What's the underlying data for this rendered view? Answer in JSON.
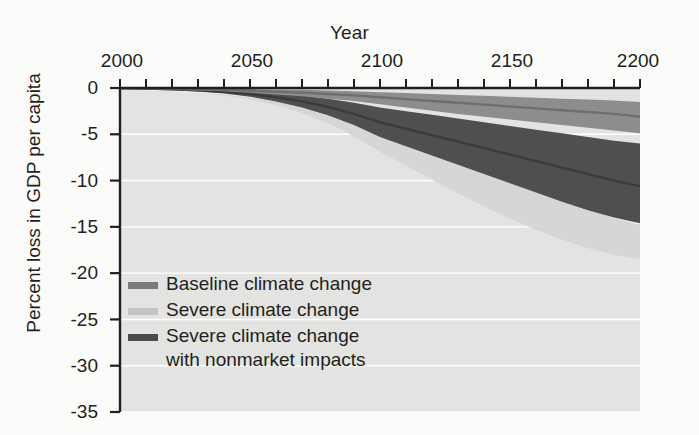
{
  "chart_data": {
    "type": "area",
    "title": "",
    "xlabel": "Year",
    "ylabel": "Percent loss in GDP per capita",
    "xlim": [
      2000,
      2200
    ],
    "ylim": [
      -35,
      0
    ],
    "grid": true,
    "grid_color": "#ffffff",
    "legend_position": "inside-lower-left",
    "x_ticks_major": [
      "2000",
      "2050",
      "2100",
      "2150",
      "2200"
    ],
    "x_tick_values_major": [
      2000,
      2050,
      2100,
      2150,
      2200
    ],
    "x_tick_interval_minor": 10,
    "y_ticks": [
      "0",
      "-5",
      "-10",
      "-15",
      "-20",
      "-25",
      "-30",
      "-35"
    ],
    "y_tick_values": [
      0,
      -5,
      -10,
      -15,
      -20,
      -25,
      -30,
      -35
    ],
    "x": [
      2000,
      2010,
      2020,
      2030,
      2040,
      2050,
      2060,
      2070,
      2080,
      2090,
      2100,
      2110,
      2120,
      2130,
      2140,
      2150,
      2160,
      2170,
      2180,
      2190,
      2200
    ],
    "series": [
      {
        "name": "Baseline climate change",
        "color": "#6e6e6e",
        "band_color": "#8d8d8d",
        "mean": [
          0,
          -0.05,
          -0.1,
          -0.15,
          -0.2,
          -0.3,
          -0.4,
          -0.5,
          -0.65,
          -0.8,
          -1.0,
          -1.2,
          -1.4,
          -1.6,
          -1.8,
          -2.0,
          -2.2,
          -2.4,
          -2.6,
          -2.8,
          -3.1
        ],
        "upper": [
          0,
          -0.02,
          -0.04,
          -0.06,
          -0.08,
          -0.12,
          -0.16,
          -0.2,
          -0.28,
          -0.35,
          -0.45,
          -0.55,
          -0.65,
          -0.75,
          -0.85,
          -0.95,
          -1.05,
          -1.15,
          -1.25,
          -1.35,
          -1.5
        ],
        "lower": [
          0,
          -0.08,
          -0.16,
          -0.25,
          -0.35,
          -0.5,
          -0.7,
          -0.9,
          -1.15,
          -1.4,
          -1.75,
          -2.1,
          -2.45,
          -2.8,
          -3.1,
          -3.4,
          -3.7,
          -4.0,
          -4.3,
          -4.6,
          -4.9
        ]
      },
      {
        "name": "Severe climate change",
        "color": "#c9c9c7",
        "band_color": "#d6d6d4",
        "mean": [
          0,
          -0.1,
          -0.2,
          -0.35,
          -0.55,
          -0.85,
          -1.3,
          -1.9,
          -2.7,
          -3.7,
          -4.9,
          -5.9,
          -6.9,
          -7.9,
          -8.9,
          -9.9,
          -10.9,
          -11.9,
          -12.9,
          -13.9,
          -14.6
        ],
        "upper": [
          0,
          -0.05,
          -0.12,
          -0.22,
          -0.35,
          -0.55,
          -0.85,
          -1.25,
          -1.8,
          -2.5,
          -3.3,
          -3.9,
          -4.5,
          -5.1,
          -5.7,
          -6.3,
          -6.9,
          -7.5,
          -8.1,
          -8.7,
          -9.2
        ],
        "lower": [
          0,
          -0.15,
          -0.3,
          -0.5,
          -0.8,
          -1.2,
          -1.85,
          -2.7,
          -3.8,
          -5.2,
          -6.9,
          -8.4,
          -9.9,
          -11.4,
          -12.8,
          -14.1,
          -15.3,
          -16.4,
          -17.3,
          -18.0,
          -18.5
        ]
      },
      {
        "name": "Severe climate change\nwith nonmarket impacts",
        "color": "#3b3b3b",
        "band_color": "#4f4f4f",
        "mean": [
          0,
          -0.07,
          -0.15,
          -0.26,
          -0.42,
          -0.65,
          -1.0,
          -1.45,
          -2.05,
          -2.8,
          -3.7,
          -4.4,
          -5.1,
          -5.8,
          -6.5,
          -7.2,
          -7.9,
          -8.6,
          -9.3,
          -10.0,
          -10.6
        ],
        "upper": [
          0,
          -0.03,
          -0.07,
          -0.13,
          -0.22,
          -0.35,
          -0.55,
          -0.8,
          -1.15,
          -1.6,
          -2.1,
          -2.5,
          -2.9,
          -3.3,
          -3.7,
          -4.1,
          -4.5,
          -4.9,
          -5.3,
          -5.7,
          -6.0
        ],
        "lower": [
          0,
          -0.1,
          -0.22,
          -0.38,
          -0.6,
          -0.95,
          -1.45,
          -2.1,
          -2.95,
          -4.0,
          -5.3,
          -6.3,
          -7.3,
          -8.3,
          -9.3,
          -10.3,
          -11.3,
          -12.3,
          -13.2,
          -14.0,
          -14.6
        ]
      }
    ],
    "legend": [
      {
        "label": "Baseline climate change",
        "color": "#7a7a7a"
      },
      {
        "label": "Severe climate change",
        "color": "#c4c4c2"
      },
      {
        "label": "Severe climate change\nwith nonmarket impacts",
        "color": "#4a4a4a"
      }
    ]
  },
  "colors": {
    "background": "#fbfbfa",
    "plot_background": "#e3e3e1",
    "gridline": "#ffffff",
    "axis": "#231f20",
    "band_light": "#d6d6d4",
    "band_mid": "#a8a8a6",
    "band_dark": "#3b3b3b"
  }
}
